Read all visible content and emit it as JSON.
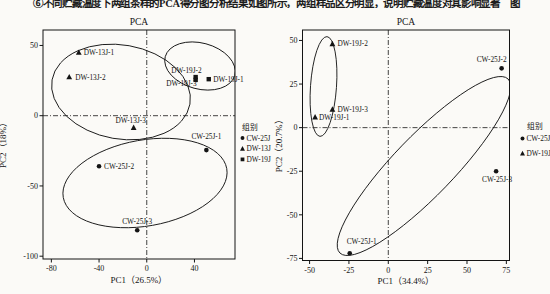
{
  "page": {
    "background": "#fbfaf7",
    "ink": "#141414"
  },
  "top_caption": {
    "text": "⑥不同贮藏温度下两组茶样的PCA得分图分析结果如图所示，两组样品区分明显，说明贮藏温度对其影响显著　图"
  },
  "chart_data": [
    {
      "type": "scatter",
      "title": "PCA",
      "xlabel": "PC1（26.5%）",
      "ylabel": "PC2（18%）",
      "xlim": [
        -87,
        74
      ],
      "ylim": [
        -102,
        61
      ],
      "x_ticks": [
        -80,
        -40,
        0,
        40
      ],
      "y_ticks": [
        50,
        0,
        -50,
        -100
      ],
      "ref_x": 0,
      "ref_y": 0,
      "grid": false,
      "legend": {
        "title": "组别",
        "position": "right-outside",
        "items": [
          {
            "marker": "circle",
            "label": "CW-25J"
          },
          {
            "marker": "triangle",
            "label": "DW-13J"
          },
          {
            "marker": "square",
            "label": "DW-19J"
          }
        ]
      },
      "series": [
        {
          "name": "CW-25J",
          "marker": "circle",
          "points": [
            {
              "label": "CW-25J-1",
              "x": 50,
              "y": -24.5,
              "anchor": "middle",
              "dx": 0,
              "dy": -11
            },
            {
              "label": "CW-25J-2",
              "x": -40,
              "y": -36,
              "anchor": "start",
              "dx": 5,
              "dy": 2.5
            },
            {
              "label": "CW-25J-3",
              "x": -8,
              "y": -81.5,
              "anchor": "middle",
              "dx": 0,
              "dy": -6.5
            }
          ]
        },
        {
          "name": "DW-13J",
          "marker": "triangle",
          "points": [
            {
              "label": "DW-13J-1",
              "x": -57,
              "y": 45,
              "anchor": "start",
              "dx": 5,
              "dy": 2.5
            },
            {
              "label": "DW-13J-2",
              "x": -65,
              "y": 27.5,
              "anchor": "start",
              "dx": 6,
              "dy": 2.5
            },
            {
              "label": "DW-13J-3",
              "x": -11,
              "y": -8.5,
              "anchor": "middle",
              "dx": -3,
              "dy": -5
            }
          ]
        },
        {
          "name": "DW-19J",
          "marker": "square",
          "points": [
            {
              "label": "DW-19J-1",
              "x": 52,
              "y": 26,
              "anchor": "start",
              "dx": 4.5,
              "dy": 2.5
            },
            {
              "label": "DW-19J-2",
              "x": 41,
              "y": 27.5,
              "anchor": "end",
              "dx": 6,
              "dy": -4
            },
            {
              "label": "DW-19J-3",
              "x": 41,
              "y": 25.5,
              "anchor": "end",
              "dx": 1,
              "dy": 6.5
            }
          ]
        }
      ],
      "ellipses": [
        {
          "cx": 121,
          "cy": 92,
          "rx": 70,
          "ry": 47,
          "rot": 10
        },
        {
          "cx": 200,
          "cy": 66,
          "rx": 36,
          "ry": 23,
          "rot": 15
        },
        {
          "cx": 145,
          "cy": 183,
          "rx": 83,
          "ry": 43,
          "rot": -10
        }
      ]
    },
    {
      "type": "scatter",
      "title": "PCA",
      "xlabel": "PC1（34.4%）",
      "ylabel": "PC2（20.7%）",
      "xlim": [
        -54.5,
        77
      ],
      "ylim": [
        -76.2,
        56
      ],
      "x_ticks": [
        -50,
        -25,
        0,
        25,
        50,
        75
      ],
      "y_ticks": [
        50,
        25,
        0,
        -25,
        -50,
        -75
      ],
      "ref_x": 0,
      "ref_y": 0,
      "grid": false,
      "legend": {
        "title": "组别",
        "position": "right-outside",
        "items": [
          {
            "marker": "circle",
            "label": "CW-25J"
          },
          {
            "marker": "triangle",
            "label": "DW-19J"
          }
        ]
      },
      "series": [
        {
          "name": "CW-25J",
          "marker": "circle",
          "points": [
            {
              "label": "CW-25J-1",
              "x": -24.5,
              "y": -72,
              "anchor": "start",
              "dx": -3,
              "dy": -9
            },
            {
              "label": "CW-25J-2",
              "x": 72,
              "y": 34,
              "anchor": "end",
              "dx": 5,
              "dy": -6
            },
            {
              "label": "CW-25J-3",
              "x": 68.5,
              "y": -25,
              "anchor": "middle",
              "dx": 1,
              "dy": 11
            }
          ]
        },
        {
          "name": "DW-19J",
          "marker": "triangle",
          "points": [
            {
              "label": "DW-19J-1",
              "x": -46.5,
              "y": 6,
              "anchor": "start",
              "dx": 4,
              "dy": 2.5
            },
            {
              "label": "DW-19J-2",
              "x": -35.5,
              "y": 48,
              "anchor": "start",
              "dx": 5,
              "dy": 2.5
            },
            {
              "label": "DW-19J-3",
              "x": -35.5,
              "y": 10.5,
              "anchor": "start",
              "dx": 5,
              "dy": 2.5
            }
          ]
        }
      ],
      "ellipses": [
        {
          "cx": 323.5,
          "cy": 86.5,
          "rx": 13,
          "ry": 50,
          "rot": 4
        },
        {
          "cx": 424,
          "cy": 166,
          "rx": 121,
          "ry": 30,
          "rot": -46
        }
      ]
    }
  ]
}
